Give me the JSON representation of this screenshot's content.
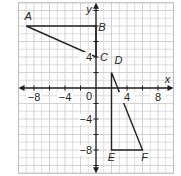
{
  "chart_data": {
    "type": "coordinate-plane",
    "xlabel": "x",
    "ylabel": "y",
    "xlim": [
      -10,
      10
    ],
    "ylim": [
      -11,
      11
    ],
    "grid": true,
    "grid_step": 2,
    "x_tick_labels": [
      {
        "value": -8,
        "label": "−8"
      },
      {
        "value": -4,
        "label": "−4"
      },
      {
        "value": 4,
        "label": "4"
      },
      {
        "value": 8,
        "label": "8"
      }
    ],
    "y_tick_labels": [
      {
        "value": 4,
        "label": "4"
      },
      {
        "value": -4,
        "label": "−4"
      },
      {
        "value": -8,
        "label": "−8"
      }
    ],
    "origin_label": "0",
    "points": [
      {
        "name": "A",
        "x": -9,
        "y": 8
      },
      {
        "name": "B",
        "x": 0,
        "y": 8
      },
      {
        "name": "C",
        "x": 0,
        "y": 4
      },
      {
        "name": "D",
        "x": 2,
        "y": 2
      },
      {
        "name": "E",
        "x": 2,
        "y": -8
      },
      {
        "name": "F",
        "x": 6,
        "y": -8
      }
    ],
    "polygons": [
      {
        "name": "triangle ABC",
        "vertices": [
          "A",
          "B",
          "C"
        ]
      },
      {
        "name": "triangle DEF",
        "vertices": [
          "D",
          "E",
          "F"
        ]
      }
    ]
  },
  "colors": {
    "grid": "#c8c8c8",
    "axis": "#231f20",
    "shape": "#231f20",
    "border": "#bdbdbd"
  }
}
